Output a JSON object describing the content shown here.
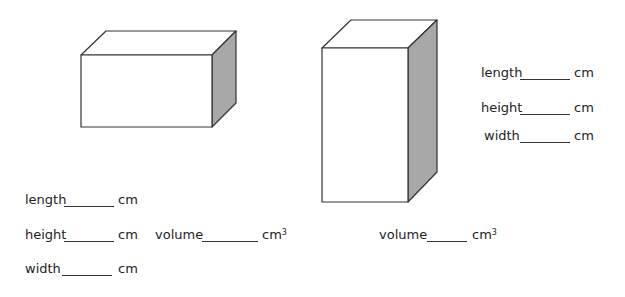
{
  "worksheet": {
    "box_a": {
      "shape": "rectangular-prism-wide",
      "side_color": "#a8a8a8",
      "fields": [
        {
          "label": "length",
          "unit": "cm",
          "value": ""
        },
        {
          "label": "height",
          "unit": "cm",
          "value": ""
        },
        {
          "label": "width",
          "unit": "cm",
          "value": ""
        }
      ],
      "volume": {
        "label": "volume",
        "unit": "cm",
        "unit_exp": "3",
        "value": ""
      }
    },
    "box_b": {
      "shape": "rectangular-prism-tall",
      "side_color": "#a8a8a8",
      "fields": [
        {
          "label": "length",
          "unit": "cm",
          "value": ""
        },
        {
          "label": "height",
          "unit": "cm",
          "value": ""
        },
        {
          "label": "width",
          "unit": "cm",
          "value": ""
        }
      ],
      "volume": {
        "label": "volume",
        "unit": "cm",
        "unit_exp": "3",
        "value": ""
      }
    }
  }
}
